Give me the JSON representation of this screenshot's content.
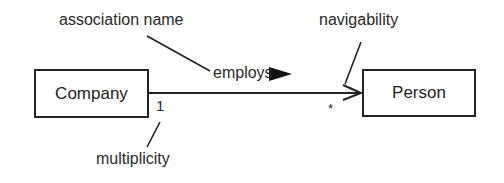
{
  "diagram": {
    "type": "UML association",
    "classes": [
      {
        "name": "Company"
      },
      {
        "name": "Person"
      }
    ],
    "association": {
      "name": "employs",
      "direction_marker": "▶",
      "source_multiplicity": "1",
      "target_multiplicity": "*"
    },
    "annotations": {
      "association_name": "association name",
      "navigability": "navigability",
      "multiplicity": "multiplicity"
    }
  }
}
